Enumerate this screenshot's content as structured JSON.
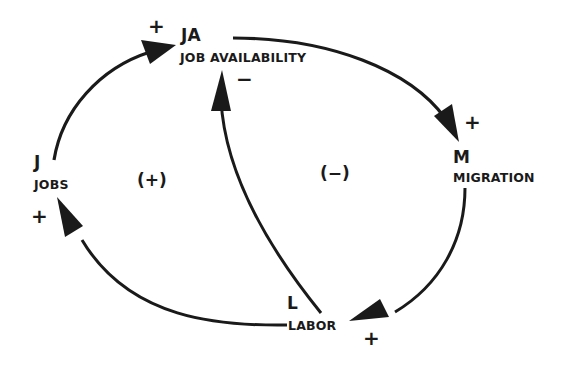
{
  "diagram": {
    "type": "causal-loop",
    "nodes": [
      {
        "id": "JA",
        "abbr": "JA",
        "name": "JOB AVAILABILITY"
      },
      {
        "id": "M",
        "abbr": "M",
        "name": "MIGRATION"
      },
      {
        "id": "L",
        "abbr": "L",
        "name": "LABOR"
      },
      {
        "id": "J",
        "abbr": "J",
        "name": "JOBS"
      }
    ],
    "links": [
      {
        "from": "J",
        "to": "JA",
        "polarity": "+"
      },
      {
        "from": "JA",
        "to": "M",
        "polarity": "+"
      },
      {
        "from": "M",
        "to": "L",
        "polarity": "+"
      },
      {
        "from": "L",
        "to": "J",
        "polarity": "+"
      },
      {
        "from": "L",
        "to": "JA",
        "polarity": "−"
      }
    ],
    "loops": [
      {
        "id": "left",
        "label": "(+)"
      },
      {
        "id": "right",
        "label": "(−)"
      }
    ],
    "colors": {
      "ink": "#1a1a1a",
      "background": "#ffffff"
    }
  }
}
